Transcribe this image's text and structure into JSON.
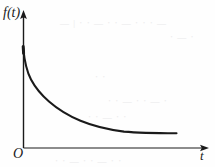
{
  "figure": {
    "background_color": "#fefefe",
    "stroke_color": "#1a1a1a",
    "labels": {
      "y_axis": "f(t)",
      "x_axis": "t",
      "origin": "O"
    },
    "ghost_marks": [
      {
        "text": "— | ⋅ ⋅ — ⋅ ⋅ — ⋅ ⋅ ⋅ —",
        "left": 60,
        "top": 18
      },
      {
        "text": "⋅ — ⋅",
        "left": 170,
        "top": 32
      },
      {
        "text": "⋅ ⋅",
        "left": 95,
        "top": 72
      },
      {
        "text": "⋅ ⋅ — ⋅ ⋅ — ⋅",
        "left": 108,
        "top": 96
      },
      {
        "text": "⋅ ⋅ — ⋅ ⋅",
        "left": 88,
        "top": 112
      },
      {
        "text": "⋅ ⋅ — ⋅ ⋅ — ⋅ ⋅",
        "left": 55,
        "top": 156
      }
    ]
  },
  "chart_data": {
    "type": "line",
    "title": "",
    "xlabel": "t",
    "ylabel": "f(t)",
    "subtitle": "",
    "grid": false,
    "legend": null,
    "axis_style": "arrowed-rays-from-origin",
    "origin_label": "O",
    "xlim": [
      0,
      11
    ],
    "ylim": [
      0,
      7
    ],
    "series": [
      {
        "name": "f(t)",
        "shape": "monotonically decreasing, convex, asymptotic to t-axis",
        "x": [
          0.0,
          0.25,
          0.5,
          0.85,
          1.3,
          1.9,
          2.6,
          3.4,
          4.3,
          5.4,
          6.5,
          7.6,
          8.7,
          9.6,
          10.0
        ],
        "y": [
          6.35,
          5.25,
          4.55,
          3.9,
          3.3,
          2.75,
          2.25,
          1.85,
          1.5,
          1.22,
          1.0,
          0.87,
          0.8,
          0.76,
          0.75
        ]
      }
    ]
  }
}
